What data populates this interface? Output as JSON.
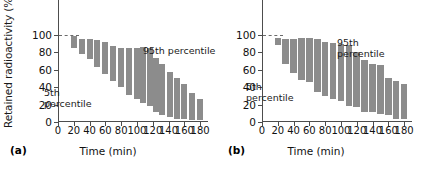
{
  "figure": {
    "width": 433,
    "height": 170,
    "background": "#ffffff",
    "bar_color": "#8c8c8c",
    "axis_color": "#4d4d4d",
    "text_color": "#111111"
  },
  "panels": [
    {
      "tag": "(a)",
      "ylabel": "Retained radioactivity (%)",
      "xlabel": "Time (min)",
      "annotations": [
        {
          "name": "fifth-percentile-label",
          "text": "5th\npercentile"
        },
        {
          "name": "ninetyfifth-percentile-label",
          "text": "95th percentile"
        }
      ]
    },
    {
      "tag": "(b)",
      "ylabel": "",
      "xlabel": "Time (min)",
      "annotations": [
        {
          "name": "fifth-percentile-label",
          "text": "5th\npercentile"
        },
        {
          "name": "ninetyfifth-percentile-label",
          "text": "95th\npercentile"
        }
      ]
    }
  ],
  "chart_data": [
    {
      "type": "bar",
      "panel": "(a)",
      "title": "",
      "xlabel": "Time (min)",
      "ylabel": "Retained radioactivity (%)",
      "xlim": [
        0,
        190
      ],
      "ylim": [
        0,
        115
      ],
      "xticks": [
        0,
        20,
        40,
        60,
        80,
        100,
        120,
        140,
        160,
        180
      ],
      "yticks": [
        0,
        20,
        40,
        60,
        80,
        100
      ],
      "grid": false,
      "legend": "none",
      "notes": "Floating bars span 5th to 95th percentile of retained radioactivity at each time point. Dashed reference line at 100%.",
      "series": [
        {
          "name": "5th percentile",
          "values": [
            85,
            78,
            72,
            63,
            55,
            47,
            40,
            31,
            26,
            22,
            18,
            12,
            8,
            6,
            4,
            3,
            2,
            2
          ]
        },
        {
          "name": "95th percentile",
          "values": [
            99,
            96,
            95,
            94,
            92,
            87,
            85,
            85,
            85,
            86,
            85,
            74,
            67,
            57,
            51,
            44,
            33,
            27
          ]
        }
      ],
      "x": [
        20,
        30,
        40,
        50,
        60,
        70,
        80,
        90,
        100,
        105,
        110,
        120,
        130,
        140,
        150,
        160,
        170,
        180
      ],
      "bars": [
        {
          "x": 20,
          "low": 85,
          "high": 99
        },
        {
          "x": 30,
          "low": 78,
          "high": 96
        },
        {
          "x": 40,
          "low": 72,
          "high": 95
        },
        {
          "x": 50,
          "low": 63,
          "high": 94
        },
        {
          "x": 60,
          "low": 55,
          "high": 92
        },
        {
          "x": 70,
          "low": 47,
          "high": 87
        },
        {
          "x": 80,
          "low": 40,
          "high": 85
        },
        {
          "x": 90,
          "low": 31,
          "high": 85
        },
        {
          "x": 100,
          "low": 26,
          "high": 85
        },
        {
          "x": 108,
          "low": 22,
          "high": 86
        },
        {
          "x": 116,
          "low": 18,
          "high": 85
        },
        {
          "x": 124,
          "low": 12,
          "high": 74
        },
        {
          "x": 132,
          "low": 8,
          "high": 67
        },
        {
          "x": 142,
          "low": 6,
          "high": 57
        },
        {
          "x": 151,
          "low": 4,
          "high": 51
        },
        {
          "x": 160,
          "low": 3,
          "high": 44
        },
        {
          "x": 170,
          "low": 2,
          "high": 33
        },
        {
          "x": 180,
          "low": 2,
          "high": 27
        }
      ]
    },
    {
      "type": "bar",
      "panel": "(b)",
      "title": "",
      "xlabel": "Time (min)",
      "ylabel": "",
      "xlim": [
        0,
        190
      ],
      "ylim": [
        0,
        115
      ],
      "xticks": [
        0,
        20,
        40,
        60,
        80,
        100,
        120,
        140,
        160,
        180
      ],
      "yticks": [
        0,
        20,
        40,
        60,
        80,
        100
      ],
      "grid": false,
      "legend": "none",
      "notes": "Floating bars span 5th to 95th percentile of retained radioactivity at each time point. Dashed reference line at 100%.",
      "series": [
        {
          "name": "5th percentile",
          "values": [
            88,
            67,
            56,
            48,
            46,
            34,
            30,
            26,
            24,
            18,
            17,
            12,
            11,
            9,
            8,
            3,
            4
          ]
        },
        {
          "name": "95th percentile",
          "values": [
            97,
            96,
            96,
            97,
            97,
            96,
            92,
            91,
            90,
            88,
            80,
            71,
            67,
            66,
            51,
            47,
            44
          ]
        }
      ],
      "x": [
        20,
        30,
        40,
        50,
        60,
        70,
        80,
        90,
        100,
        110,
        120,
        130,
        140,
        150,
        160,
        170,
        180
      ],
      "bars": [
        {
          "x": 20,
          "low": 88,
          "high": 97
        },
        {
          "x": 30,
          "low": 67,
          "high": 96
        },
        {
          "x": 40,
          "low": 56,
          "high": 96
        },
        {
          "x": 50,
          "low": 48,
          "high": 97
        },
        {
          "x": 60,
          "low": 46,
          "high": 97
        },
        {
          "x": 70,
          "low": 34,
          "high": 96
        },
        {
          "x": 80,
          "low": 30,
          "high": 92
        },
        {
          "x": 90,
          "low": 26,
          "high": 91
        },
        {
          "x": 100,
          "low": 24,
          "high": 90
        },
        {
          "x": 110,
          "low": 18,
          "high": 88
        },
        {
          "x": 120,
          "low": 17,
          "high": 80
        },
        {
          "x": 130,
          "low": 12,
          "high": 71
        },
        {
          "x": 140,
          "low": 11,
          "high": 67
        },
        {
          "x": 150,
          "low": 9,
          "high": 66
        },
        {
          "x": 160,
          "low": 8,
          "high": 51
        },
        {
          "x": 170,
          "low": 3,
          "high": 47
        },
        {
          "x": 180,
          "low": 4,
          "high": 44
        }
      ]
    }
  ]
}
